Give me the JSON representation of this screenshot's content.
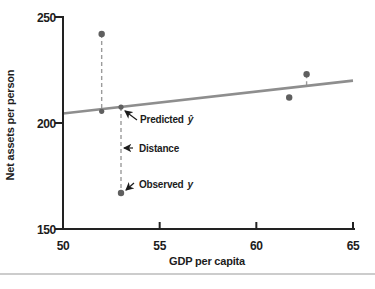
{
  "chart_data": {
    "type": "scatter",
    "title": "",
    "xlabel": "GDP per capita",
    "ylabel": "Net assets per person",
    "xlim": [
      50,
      65
    ],
    "ylim": [
      150,
      250
    ],
    "x_ticks": [
      50,
      55,
      60,
      65
    ],
    "y_ticks": [
      150,
      200,
      250
    ],
    "grid": false,
    "legend": "none",
    "regression_line": {
      "x": [
        50,
        65
      ],
      "y": [
        204.5,
        220
      ]
    },
    "observed_points": [
      {
        "x": 52,
        "y": 242
      },
      {
        "x": 53,
        "y": 167
      },
      {
        "x": 61.7,
        "y": 212
      },
      {
        "x": 62.6,
        "y": 223
      }
    ],
    "fitted_points": [
      {
        "x": 52,
        "y": 205.5
      },
      {
        "x": 53,
        "y": 207.5
      }
    ],
    "residual_segments": [
      {
        "x": 52,
        "y1": 242,
        "y2": 205.5
      },
      {
        "x": 53,
        "y1": 207.5,
        "y2": 167
      },
      {
        "x": 62.6,
        "y1": 223,
        "y2": 217.5
      }
    ],
    "annotations": {
      "predicted": {
        "text": "Predicted",
        "symbol": "ŷ"
      },
      "distance": {
        "text": "Distance",
        "symbol": ""
      },
      "observed": {
        "text": "Observed",
        "symbol": "y"
      }
    },
    "style": {
      "line_color": "#8e8e8e",
      "point_color": "#5f5f5f",
      "dash_color": "#9b9b9b",
      "axis_color": "#222222",
      "text_color": "#1c1c1c",
      "divider_color": "#cccccc",
      "background": "#ffffff"
    }
  }
}
